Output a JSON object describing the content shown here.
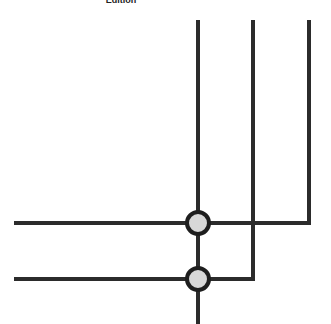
{
  "caption": "Edition",
  "colors": {
    "line": "#2b2b2b",
    "node_fill": "#d8d8d8",
    "node_stroke": "#1e1e1e"
  },
  "diagram": {
    "vertical_lines": [
      {
        "x": 198,
        "y1": 20,
        "y2": 324
      },
      {
        "x": 253,
        "y1": 20,
        "y2": 279
      },
      {
        "x": 309,
        "y1": 20,
        "y2": 223
      }
    ],
    "horizontal_lines": [
      {
        "y": 223,
        "x1": 14,
        "x2": 309
      },
      {
        "y": 279,
        "x1": 14,
        "x2": 253
      }
    ],
    "nodes": [
      {
        "cx": 198,
        "cy": 223,
        "r": 11
      },
      {
        "cx": 198,
        "cy": 279,
        "r": 11
      }
    ]
  }
}
